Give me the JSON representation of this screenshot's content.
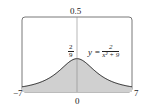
{
  "chart_data": {
    "type": "area",
    "title": "",
    "function": "y = 2/(x^2+9)",
    "equation_label": {
      "lhs": "y =",
      "numerator": "2",
      "denominator": "x² + 9"
    },
    "xlim": [
      -7,
      7
    ],
    "ylim": [
      0,
      0.5
    ],
    "x_tick_labels": [
      "−7",
      "0",
      "7"
    ],
    "y_tick_labels": [
      "0.5"
    ],
    "peak_label": {
      "numerator": "2",
      "denominator": "9"
    },
    "peak": {
      "x": 0,
      "y": 0.2222
    },
    "x": [
      -7,
      -6,
      -5,
      -4,
      -3,
      -2,
      -1,
      0,
      1,
      2,
      3,
      4,
      5,
      6,
      7
    ],
    "values": [
      0.0345,
      0.0444,
      0.0588,
      0.08,
      0.1111,
      0.1538,
      0.2,
      0.2222,
      0.2,
      0.1538,
      0.1111,
      0.08,
      0.0588,
      0.0444,
      0.0345
    ],
    "shaded_region": "area under curve from x=-7 to x=7",
    "grid": false,
    "colors": {
      "fill": "#d0d0d0",
      "curve": "#222222",
      "frame": "#555555"
    }
  }
}
